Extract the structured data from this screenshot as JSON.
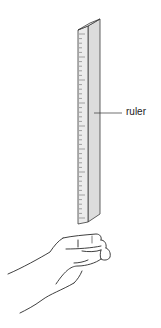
{
  "diagram": {
    "labels": [
      {
        "id": "ruler",
        "text": "ruler"
      }
    ],
    "objects": {
      "ruler": {
        "face_color": "#e4e4e4",
        "edge_color": "#3a3a3a",
        "side_color": "#d6d6d6",
        "tick_count": 40
      },
      "hand": {
        "stroke_color": "#2a2a2a"
      }
    }
  }
}
